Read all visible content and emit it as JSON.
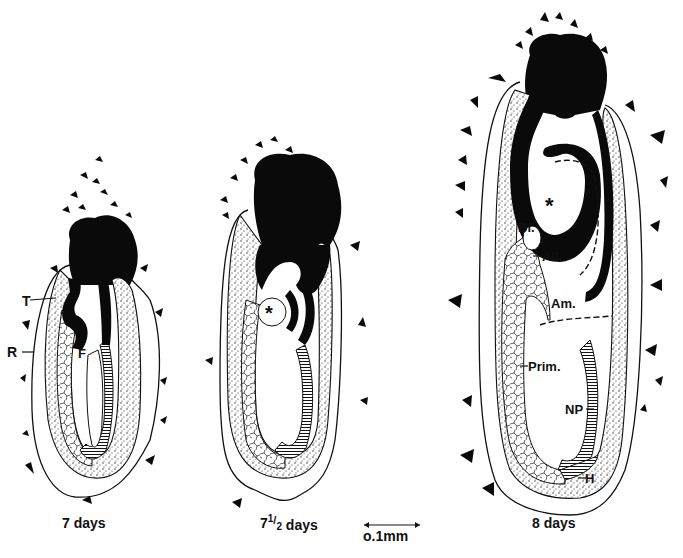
{
  "figure": {
    "panels": [
      {
        "caption": "7 days",
        "labels": {
          "T": "T",
          "R": "R",
          "F": "F"
        }
      },
      {
        "caption_main": "7",
        "caption_fraction_num": "1",
        "caption_fraction_den": "2",
        "caption_suffix": " days",
        "labels": {
          "asterisk": "*"
        }
      },
      {
        "caption": "8 days",
        "labels": {
          "E": "E",
          "asterisk": "*",
          "Bl": "Bl.",
          "All": "All.",
          "Am": "Am.",
          "Prim": "Prim.",
          "NP": "NP",
          "H": "H"
        }
      }
    ],
    "scale_bar": {
      "label": "o.1mm"
    }
  },
  "colors": {
    "ink": "#0a0a0a",
    "paper": "#ffffff"
  }
}
